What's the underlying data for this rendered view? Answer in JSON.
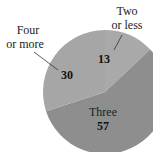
{
  "chart_data": {
    "type": "pie",
    "title": "",
    "categories": [
      "Two or less",
      "Three",
      "Four or more"
    ],
    "values": [
      13,
      57,
      30
    ],
    "colors": [
      "#a9a9a9",
      "#8e8e8e",
      "#a6a6a6"
    ],
    "label_lines": [
      [
        "Two",
        "or less"
      ],
      [
        "Three"
      ],
      [
        "Four",
        "or more"
      ]
    ],
    "start_angle_deg": 0,
    "direction": "clockwise",
    "legend": "none"
  }
}
